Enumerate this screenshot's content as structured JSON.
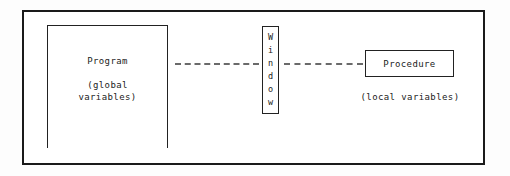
{
  "diagram": {
    "background_color": "#fdfdfd",
    "frame_color": "#1a1a1a",
    "box_border_color": "#222222",
    "dash_color": "#6a6a6a",
    "text_color": "#1b1b1b"
  },
  "program": {
    "label": "Program",
    "sub_line1": "(global",
    "sub_line2": "variables)"
  },
  "window": {
    "label": "Window",
    "letters": [
      "W",
      "i",
      "n",
      "d",
      "o",
      "w"
    ]
  },
  "procedure": {
    "label": "Procedure",
    "sub": "(local variables)"
  },
  "connectors": {
    "left_dash_label": "dashed connector program to window",
    "right_dash_label": "dashed connector window to procedure"
  }
}
